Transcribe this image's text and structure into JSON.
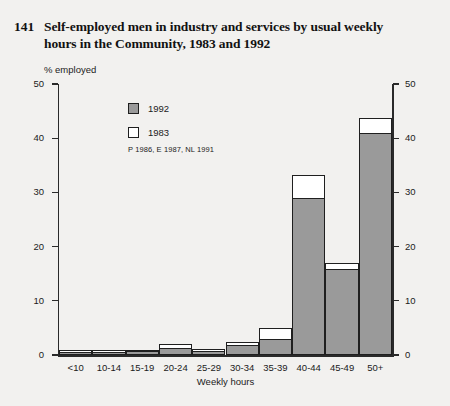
{
  "title": {
    "number": "141",
    "text": "Self-employed men in industry and services by usual weekly hours in the Community, 1983 and 1992"
  },
  "legend": {
    "items": [
      {
        "label": "1992",
        "style": "filled",
        "color": "#9a9a9a"
      },
      {
        "label": "1983",
        "style": "hollow",
        "color": "#ffffff"
      }
    ],
    "note": "P 1986, E 1987, NL 1991"
  },
  "axes": {
    "y_label": "% employed",
    "x_label": "Weekly hours",
    "y_ticks": [
      "0",
      "10",
      "20",
      "30",
      "40",
      "50"
    ],
    "y_ticks_right": [
      "0",
      "10",
      "20",
      "30",
      "40",
      "50"
    ]
  },
  "chart_data": {
    "type": "bar",
    "title": "Self-employed men in industry and services by usual weekly hours in the Community, 1983 and 1992",
    "xlabel": "Weekly hours",
    "ylabel": "% employed",
    "ylim": [
      0,
      50
    ],
    "ytick_step": 10,
    "grid": false,
    "legend_position": "upper-left-inside",
    "categories": [
      "<10",
      "10-14",
      "15-19",
      "20-24",
      "25-29",
      "30-34",
      "35-39",
      "40-44",
      "45-49",
      "50+"
    ],
    "series": [
      {
        "name": "1992",
        "style": "filled",
        "color": "#9a9a9a",
        "values": [
          0.6,
          0.6,
          0.7,
          1.3,
          0.8,
          1.9,
          3.0,
          29.0,
          15.8,
          41.0
        ]
      },
      {
        "name": "1983",
        "style": "outline",
        "color": "#ffffff",
        "values": [
          0.9,
          0.9,
          1.0,
          2.1,
          1.1,
          2.4,
          5.0,
          33.2,
          17.0,
          43.8
        ]
      }
    ],
    "notes": "P 1986, E 1987, NL 1991"
  }
}
